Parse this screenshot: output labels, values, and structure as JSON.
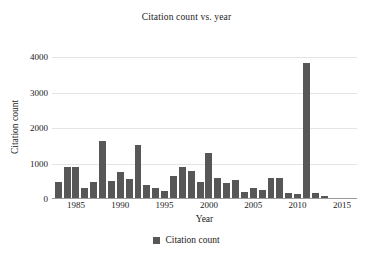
{
  "chart_data": {
    "type": "bar",
    "title": "Citation count vs. year",
    "xlabel": "Year",
    "ylabel": "Citation count",
    "legend": [
      {
        "label": "Citation count",
        "color": "#575757",
        "marker": "square"
      }
    ],
    "legend_position": "bottom-center",
    "grid": true,
    "grid_axis": "y",
    "bar_color": "#575757",
    "xlim": [
      1982.3,
      2016.7
    ],
    "ylim": [
      0,
      4200
    ],
    "yticks": [
      0,
      1000,
      2000,
      3000,
      4000
    ],
    "ytick_labels": [
      "0",
      "1000",
      "2000",
      "3000",
      "4000"
    ],
    "xticks": [
      1985,
      1990,
      1995,
      2000,
      2005,
      2010,
      2015
    ],
    "xtick_labels": [
      "1985",
      "1990",
      "1995",
      "2000",
      "2005",
      "2010",
      "2015"
    ],
    "categories": [
      1983,
      1984,
      1985,
      1986,
      1987,
      1988,
      1989,
      1990,
      1991,
      1992,
      1993,
      1994,
      1995,
      1996,
      1997,
      1998,
      1999,
      2000,
      2001,
      2002,
      2003,
      2004,
      2005,
      2006,
      2007,
      2008,
      2009,
      2010,
      2011,
      2012,
      2013,
      2014,
      2015,
      2016
    ],
    "values": [
      470,
      900,
      910,
      320,
      480,
      1630,
      520,
      760,
      560,
      1530,
      390,
      310,
      240,
      650,
      890,
      800,
      480,
      1310,
      600,
      440,
      530,
      210,
      300,
      250,
      580,
      600,
      170,
      130,
      3840,
      160,
      80,
      40,
      20,
      10
    ],
    "series": [
      {
        "name": "Citation count",
        "color": "#575757",
        "values": [
          470,
          900,
          910,
          320,
          480,
          1630,
          520,
          760,
          560,
          1530,
          390,
          310,
          240,
          650,
          890,
          800,
          480,
          1310,
          600,
          440,
          530,
          210,
          300,
          250,
          580,
          600,
          170,
          130,
          3840,
          160,
          80,
          40,
          20,
          10
        ]
      }
    ],
    "max_value": 3840,
    "max_value_category": 2011
  }
}
